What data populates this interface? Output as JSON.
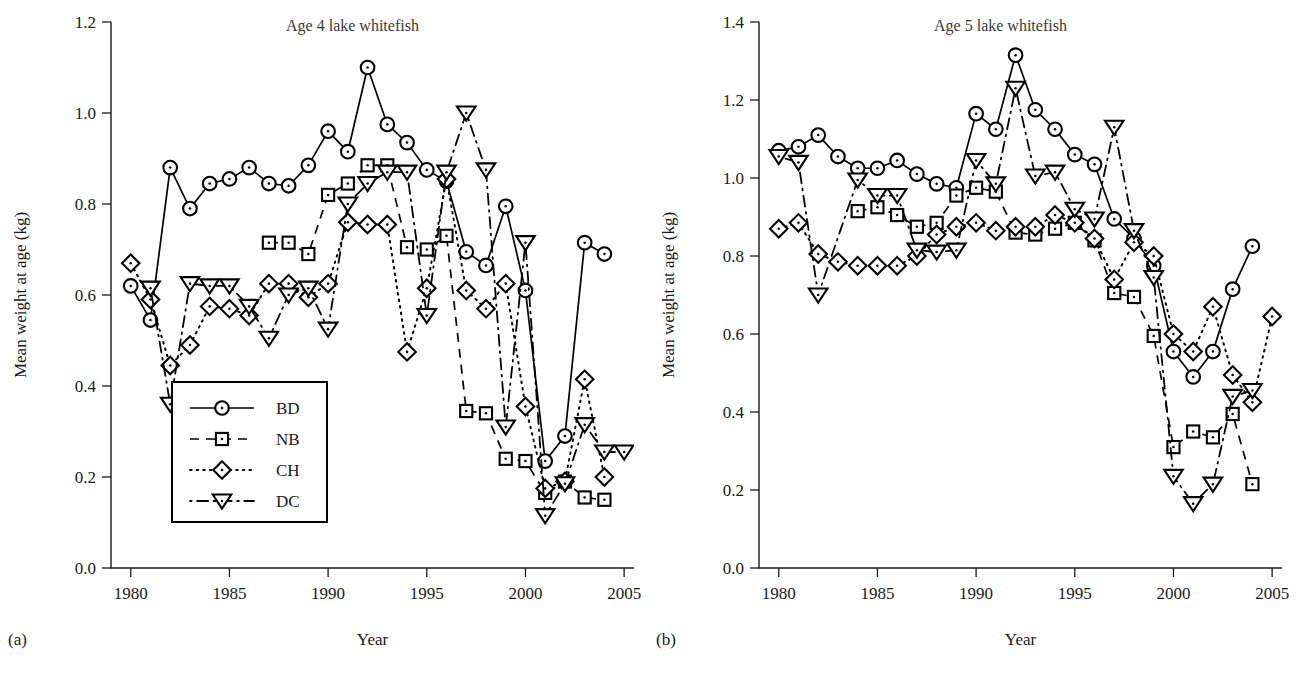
{
  "figure": {
    "background": "#ffffff",
    "ink": "#000000",
    "panel_tags": [
      "(a)",
      "(b)"
    ]
  },
  "legend": {
    "position": "lower-left-panel-a",
    "entries": [
      {
        "label": "BD",
        "marker": "circle",
        "line": "solid"
      },
      {
        "label": "NB",
        "marker": "square",
        "line": "dashed"
      },
      {
        "label": "CH",
        "marker": "diamond",
        "line": "dotted"
      },
      {
        "label": "DC",
        "marker": "triangle-down",
        "line": "dash-dot"
      }
    ]
  },
  "chart_data": [
    {
      "type": "line",
      "panel": "(a)",
      "title": "Age 4 lake whitefish",
      "xlabel": "Year",
      "ylabel": "Mean weight at age (kg)",
      "xlim": [
        1979,
        2005.5
      ],
      "ylim": [
        0.0,
        1.2
      ],
      "xticks": [
        1980,
        1985,
        1990,
        1995,
        2000,
        2005
      ],
      "yticks": [
        0.0,
        0.2,
        0.4,
        0.6,
        0.8,
        1.0,
        1.2
      ],
      "ytick_labels": [
        "0.0",
        "0.2",
        "0.4",
        "0.6",
        "0.8",
        "1.0",
        "1.2"
      ],
      "xtick_labels": [
        "1980",
        "1985",
        "1990",
        "1995",
        "2000",
        "2005"
      ],
      "grid": false,
      "legend": true,
      "series": [
        {
          "name": "BD",
          "marker": "circle",
          "line": "solid",
          "x": [
            1980,
            1981,
            1982,
            1983,
            1984,
            1985,
            1986,
            1987,
            1988,
            1989,
            1990,
            1991,
            1992,
            1993,
            1994,
            1995,
            1996,
            1997,
            1998,
            1999,
            2000,
            2001,
            2002,
            2003,
            2004
          ],
          "values": [
            0.62,
            0.545,
            0.88,
            0.79,
            0.845,
            0.855,
            0.88,
            0.845,
            0.84,
            0.885,
            0.96,
            0.915,
            1.1,
            0.975,
            0.935,
            0.875,
            0.85,
            0.695,
            0.665,
            0.795,
            0.61,
            0.235,
            0.29,
            0.715,
            0.69
          ]
        },
        {
          "name": "NB",
          "marker": "square",
          "line": "dashed",
          "x": [
            1987,
            1988,
            1989,
            1990,
            1991,
            1992,
            1993,
            1994,
            1995,
            1996,
            1997,
            1998,
            1999,
            2000,
            2001,
            2002,
            2003,
            2004
          ],
          "values": [
            0.715,
            0.715,
            0.69,
            0.82,
            0.845,
            0.885,
            0.885,
            0.705,
            0.7,
            0.73,
            0.345,
            0.34,
            0.24,
            0.235,
            0.165,
            0.19,
            0.155,
            0.15
          ]
        },
        {
          "name": "CH",
          "marker": "diamond",
          "line": "dotted",
          "x": [
            1980,
            1981,
            1982,
            1983,
            1984,
            1985,
            1986,
            1987,
            1988,
            1989,
            1990,
            1991,
            1992,
            1993,
            1994,
            1995,
            1996,
            1997,
            1998,
            1999,
            2000,
            2001,
            2002,
            2003,
            2004
          ],
          "values": [
            0.67,
            0.59,
            0.445,
            0.49,
            0.575,
            0.57,
            0.555,
            0.625,
            0.625,
            0.595,
            0.625,
            0.76,
            0.755,
            0.755,
            0.475,
            0.615,
            0.855,
            0.61,
            0.57,
            0.625,
            0.355,
            0.175,
            0.19,
            0.415,
            0.2
          ]
        },
        {
          "name": "DC",
          "marker": "triangle-down",
          "line": "dash-dot",
          "x": [
            1981,
            1982,
            1983,
            1984,
            1985,
            1986,
            1987,
            1988,
            1989,
            1990,
            1991,
            1992,
            1993,
            1994,
            1995,
            1996,
            1997,
            1998,
            1999,
            2000,
            2001,
            2002,
            2003,
            2004,
            2005
          ],
          "values": [
            0.615,
            0.36,
            0.625,
            0.62,
            0.62,
            0.575,
            0.505,
            0.6,
            0.615,
            0.525,
            0.8,
            0.845,
            0.87,
            0.87,
            0.555,
            0.87,
            1.0,
            0.875,
            0.31,
            0.715,
            0.115,
            0.185,
            0.315,
            0.255,
            0.255
          ]
        }
      ]
    },
    {
      "type": "line",
      "panel": "(b)",
      "title": "Age 5 lake whitefish",
      "xlabel": "Year",
      "ylabel": "Mean weight at age (kg)",
      "xlim": [
        1979,
        2005.5
      ],
      "ylim": [
        0.0,
        1.4
      ],
      "xticks": [
        1980,
        1985,
        1990,
        1995,
        2000,
        2005
      ],
      "yticks": [
        0.0,
        0.2,
        0.4,
        0.6,
        0.8,
        1.0,
        1.2,
        1.4
      ],
      "ytick_labels": [
        "0.0",
        "0.2",
        "0.4",
        "0.6",
        "0.8",
        "1.0",
        "1.2",
        "1.4"
      ],
      "xtick_labels": [
        "1980",
        "1985",
        "1990",
        "1995",
        "2000",
        "2005"
      ],
      "grid": false,
      "legend": false,
      "series": [
        {
          "name": "BD",
          "marker": "circle",
          "line": "solid",
          "x": [
            1980,
            1981,
            1982,
            1983,
            1984,
            1985,
            1986,
            1987,
            1988,
            1989,
            1990,
            1991,
            1992,
            1993,
            1994,
            1995,
            1996,
            1997,
            1998,
            1999,
            2000,
            2001,
            2002,
            2003,
            2004
          ],
          "values": [
            1.07,
            1.08,
            1.11,
            1.055,
            1.025,
            1.025,
            1.045,
            1.01,
            0.985,
            0.975,
            1.165,
            1.125,
            1.315,
            1.175,
            1.125,
            1.06,
            1.035,
            0.895,
            0.845,
            0.775,
            0.555,
            0.49,
            0.555,
            0.715,
            0.825
          ]
        },
        {
          "name": "NB",
          "marker": "square",
          "line": "dashed",
          "x": [
            1984,
            1985,
            1986,
            1987,
            1988,
            1989,
            1990,
            1991,
            1992,
            1993,
            1994,
            1995,
            1996,
            1997,
            1998,
            1999,
            2000,
            2001,
            2002,
            2003,
            2004
          ],
          "values": [
            0.915,
            0.925,
            0.905,
            0.875,
            0.885,
            0.955,
            0.975,
            0.965,
            0.86,
            0.855,
            0.87,
            0.885,
            0.84,
            0.705,
            0.695,
            0.595,
            0.31,
            0.35,
            0.335,
            0.395,
            0.215
          ]
        },
        {
          "name": "CH",
          "marker": "diamond",
          "line": "dotted",
          "x": [
            1980,
            1981,
            1982,
            1983,
            1984,
            1985,
            1986,
            1987,
            1988,
            1989,
            1990,
            1991,
            1992,
            1993,
            1994,
            1995,
            1996,
            1997,
            1998,
            1999,
            2000,
            2001,
            2002,
            2003,
            2004,
            2005
          ],
          "values": [
            0.87,
            0.885,
            0.805,
            0.785,
            0.775,
            0.775,
            0.775,
            0.8,
            0.855,
            0.875,
            0.885,
            0.865,
            0.875,
            0.875,
            0.905,
            0.885,
            0.845,
            0.74,
            0.835,
            0.8,
            0.6,
            0.555,
            0.67,
            0.495,
            0.425,
            0.645
          ]
        },
        {
          "name": "DC",
          "marker": "triangle-down",
          "line": "dash-dot",
          "x": [
            1980,
            1981,
            1982,
            1984,
            1985,
            1986,
            1987,
            1988,
            1989,
            1990,
            1991,
            1992,
            1993,
            1994,
            1995,
            1996,
            1997,
            1998,
            1999,
            2000,
            2001,
            2002,
            2003,
            2004
          ],
          "values": [
            1.055,
            1.04,
            0.7,
            0.995,
            0.955,
            0.955,
            0.815,
            0.81,
            0.815,
            1.045,
            0.985,
            1.23,
            1.005,
            1.015,
            0.92,
            0.895,
            1.13,
            0.865,
            0.745,
            0.235,
            0.165,
            0.215,
            0.44,
            0.455
          ]
        }
      ]
    }
  ]
}
